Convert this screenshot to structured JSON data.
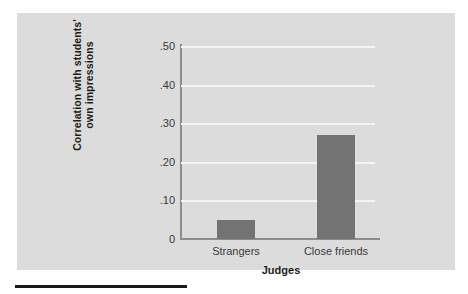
{
  "figure": {
    "panel_background": "#dcdcdc",
    "bar_color": "#737373",
    "gridline_color": "#f4f4f4",
    "axis_color": "#8c8c8c",
    "caption_rule_color": "#1a1a1a"
  },
  "chart_data": {
    "type": "bar",
    "title": "",
    "subtitle": "",
    "xlabel": "Judges",
    "ylabel": "Correlation with students' own impressions",
    "ylabel_line1": "Correlation with students'",
    "ylabel_line2": "own impressions",
    "categories": [
      "Strangers",
      "Close friends"
    ],
    "values": [
      0.05,
      0.27
    ],
    "ylim": [
      0,
      0.5
    ],
    "ytick_values": [
      0.5,
      0.4,
      0.3,
      0.2,
      0.1,
      0
    ],
    "ytick_labels": [
      ".50",
      ".40",
      ".30",
      ".20",
      ".10",
      "0"
    ],
    "grid": true,
    "grid_axis": "y",
    "legend": false,
    "legend_position": "none",
    "series": [
      {
        "name": "Correlation with students' own impressions",
        "values": [
          0.05,
          0.27
        ]
      }
    ]
  }
}
